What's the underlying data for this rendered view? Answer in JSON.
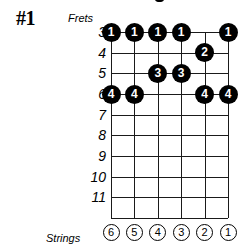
{
  "diagram": {
    "pattern_label": "#1",
    "frets_caption": "Frets",
    "strings_caption": "Strings",
    "fret_numbers": [
      "3",
      "4",
      "5",
      "6",
      "7",
      "8",
      "9",
      "10",
      "11"
    ],
    "string_numbers": [
      "6",
      "5",
      "4",
      "3",
      "2",
      "1"
    ],
    "colors": {
      "dot_fill": "#000000",
      "dot_text": "#ffffff",
      "grid_line": "#1a1a1a",
      "background": "#ffffff",
      "text": "#000000"
    },
    "fingerings": [
      {
        "fret": "3",
        "string": "6",
        "finger": "1"
      },
      {
        "fret": "3",
        "string": "5",
        "finger": "1"
      },
      {
        "fret": "3",
        "string": "4",
        "finger": "1"
      },
      {
        "fret": "3",
        "string": "3",
        "finger": "1"
      },
      {
        "fret": "3",
        "string": "1",
        "finger": "1"
      },
      {
        "fret": "4",
        "string": "2",
        "finger": "2"
      },
      {
        "fret": "5",
        "string": "4",
        "finger": "3"
      },
      {
        "fret": "5",
        "string": "3",
        "finger": "3"
      },
      {
        "fret": "6",
        "string": "6",
        "finger": "4"
      },
      {
        "fret": "6",
        "string": "5",
        "finger": "4"
      },
      {
        "fret": "6",
        "string": "2",
        "finger": "4"
      },
      {
        "fret": "6",
        "string": "1",
        "finger": "4"
      }
    ]
  }
}
